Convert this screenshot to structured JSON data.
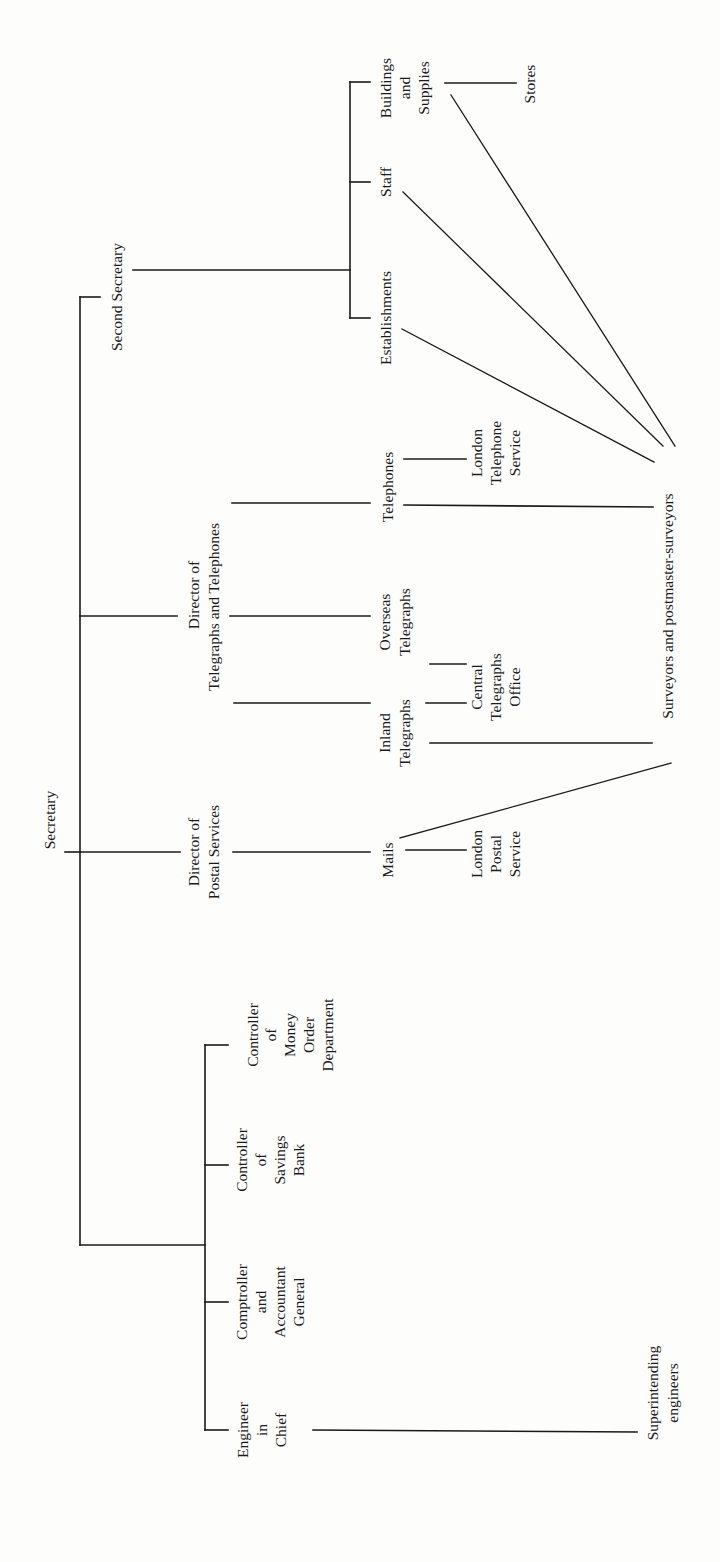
{
  "diagram": {
    "type": "organization-chart",
    "orientation": "rotated-90-counterclockwise",
    "nodes": {
      "secretary": {
        "lines": [
          "Secretary"
        ]
      },
      "second_secretary": {
        "lines": [
          "Second Secretary"
        ]
      },
      "director_postal": {
        "lines": [
          "Director of",
          "Postal Services"
        ]
      },
      "director_tt": {
        "lines": [
          "Director of",
          "Telegraphs and Telephones"
        ]
      },
      "establishments": {
        "lines": [
          "Establishments"
        ]
      },
      "staff": {
        "lines": [
          "Staff"
        ]
      },
      "buildings": {
        "lines": [
          "Buildings",
          "and",
          "Supplies"
        ]
      },
      "stores": {
        "lines": [
          "Stores"
        ]
      },
      "telephones": {
        "lines": [
          "Telephones"
        ]
      },
      "london_telephone": {
        "lines": [
          "London",
          "Telephone",
          "Service"
        ]
      },
      "overseas": {
        "lines": [
          "Overseas",
          "Telegraphs"
        ]
      },
      "inland": {
        "lines": [
          "Inland",
          "Telegraphs"
        ]
      },
      "central_telegraphs": {
        "lines": [
          "Central",
          "Telegraphs",
          "Office"
        ]
      },
      "mails": {
        "lines": [
          "Mails"
        ]
      },
      "london_postal": {
        "lines": [
          "London",
          "Postal",
          "Service"
        ]
      },
      "surveyors": {
        "lines": [
          "Surveyors and postmaster-surveyors"
        ]
      },
      "money_order": {
        "lines": [
          "Controller",
          "of",
          "Money",
          "Order",
          "Department"
        ]
      },
      "savings_bank": {
        "lines": [
          "Controller",
          "of",
          "Savings",
          "Bank"
        ]
      },
      "comptroller": {
        "lines": [
          "Comptroller",
          "and",
          "Accountant",
          "General"
        ]
      },
      "engineer": {
        "lines": [
          "Engineer",
          "in",
          "Chief"
        ]
      },
      "superintending": {
        "lines": [
          "Superintending",
          "engineers"
        ]
      }
    },
    "edges": [
      [
        "secretary",
        "second_secretary"
      ],
      [
        "secretary",
        "director_tt"
      ],
      [
        "secretary",
        "director_postal"
      ],
      [
        "secretary",
        "money_order"
      ],
      [
        "secretary",
        "savings_bank"
      ],
      [
        "secretary",
        "comptroller"
      ],
      [
        "secretary",
        "engineer"
      ],
      [
        "second_secretary",
        "establishments"
      ],
      [
        "second_secretary",
        "staff"
      ],
      [
        "second_secretary",
        "buildings"
      ],
      [
        "buildings",
        "stores"
      ],
      [
        "director_tt",
        "telephones"
      ],
      [
        "director_tt",
        "overseas"
      ],
      [
        "director_tt",
        "inland"
      ],
      [
        "telephones",
        "london_telephone"
      ],
      [
        "inland",
        "central_telegraphs"
      ],
      [
        "overseas",
        "central_telegraphs"
      ],
      [
        "director_postal",
        "mails"
      ],
      [
        "mails",
        "london_postal"
      ],
      [
        "establishments",
        "surveyors"
      ],
      [
        "staff",
        "surveyors"
      ],
      [
        "buildings",
        "surveyors"
      ],
      [
        "telephones",
        "surveyors"
      ],
      [
        "inland",
        "surveyors"
      ],
      [
        "mails",
        "surveyors"
      ],
      [
        "engineer",
        "superintending"
      ]
    ]
  }
}
